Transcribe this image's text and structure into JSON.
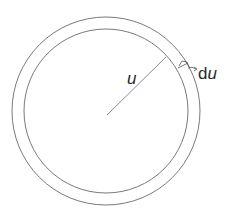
{
  "diagram": {
    "type": "annular-ring",
    "labels": {
      "radius": "u",
      "thickness_prefix": "d",
      "thickness_var": "u"
    },
    "geometry": {
      "center": [
        106,
        111
      ],
      "outer_radius": 94,
      "inner_radius": 82
    },
    "stroke_color": "#7a7a7a",
    "text_color": "#2a2a2a"
  }
}
